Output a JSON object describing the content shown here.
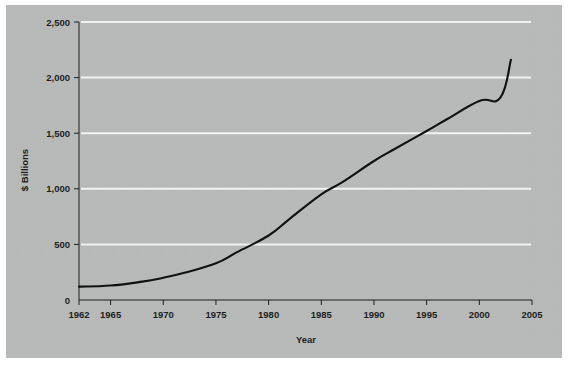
{
  "chart_data": {
    "type": "line",
    "title": "",
    "subtitle": "",
    "xlabel": "Year",
    "ylabel": "$ Billions",
    "xlim": [
      1962,
      2005
    ],
    "ylim": [
      0,
      2500
    ],
    "grid": "horizontal",
    "legend": "none",
    "background_color": "#b8bbba",
    "gridline_color": "#f2f2f0",
    "line_color": "#111111",
    "axis_color": "#1d1f1e",
    "xticks": [
      1962,
      1965,
      1970,
      1975,
      1980,
      1985,
      1990,
      1995,
      2000,
      2005
    ],
    "xtick_labels": [
      "1962",
      "1965",
      "1970",
      "1975",
      "1980",
      "1985",
      "1990",
      "1995",
      "2000",
      "2005"
    ],
    "yticks": [
      0,
      500,
      1000,
      1500,
      2000,
      2500
    ],
    "ytick_labels": [
      "0",
      "500",
      "1,000",
      "1,500",
      "2,000",
      "2,500"
    ],
    "series": [
      {
        "name": "",
        "x": [
          1962,
          1965,
          1968,
          1970,
          1972,
          1975,
          1977,
          1980,
          1982,
          1985,
          1987,
          1990,
          1992,
          1995,
          1997,
          2000,
          2002,
          2003
        ],
        "values": [
          120,
          130,
          165,
          200,
          245,
          330,
          430,
          580,
          730,
          950,
          1060,
          1250,
          1360,
          1520,
          1630,
          1790,
          1820,
          2160
        ]
      }
    ]
  }
}
